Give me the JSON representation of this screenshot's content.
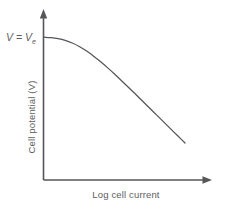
{
  "figure": {
    "background_color": "#ffffff",
    "line_color": "#55555a",
    "text_color": "#5d5d61",
    "width": 227,
    "height": 210
  },
  "labels": {
    "equilibrium_v": "V",
    "equilibrium_eq": " = ",
    "equilibrium_v2": "V",
    "equilibrium_subscript": "e",
    "y_axis": "Cell potential (V)",
    "x_axis": "Log cell current"
  },
  "chart_data": {
    "type": "line",
    "title": "",
    "subtitle": "",
    "xlabel": "Log cell current",
    "ylabel": "Cell potential (V)",
    "grid": false,
    "legend": false,
    "axes_style": "arrow-terminated, no tick marks, no tick labels",
    "annotations": [
      {
        "text": "V = Ve",
        "meaning": "open-circuit / equilibrium cell potential at the y-axis intercept",
        "attached_to_point": [
          0.0,
          1.0
        ],
        "position": "left of y-axis, aligned with curve start"
      }
    ],
    "xlim": [
      0,
      1
    ],
    "ylim": [
      0,
      1
    ],
    "series": [
      {
        "name": "Cell polarization curve",
        "comment": "Normalized coordinates: x 0..1 left-to-right along Log cell current, y 0..1 bottom-to-top along Cell potential. Flat at V=Ve near zero current, then curving down and becoming linear (Tafel-like) at high current.",
        "x": [
          0.0,
          0.05,
          0.1,
          0.15,
          0.2,
          0.25,
          0.3,
          0.35,
          0.4,
          0.45,
          0.5,
          0.55,
          0.6,
          0.65,
          0.7,
          0.75,
          0.8,
          0.85,
          0.9,
          0.95,
          1.0
        ],
        "y": [
          1.0,
          0.997,
          0.99,
          0.978,
          0.96,
          0.936,
          0.906,
          0.871,
          0.832,
          0.79,
          0.746,
          0.7,
          0.653,
          0.606,
          0.558,
          0.51,
          0.462,
          0.414,
          0.366,
          0.318,
          0.27
        ]
      }
    ]
  }
}
